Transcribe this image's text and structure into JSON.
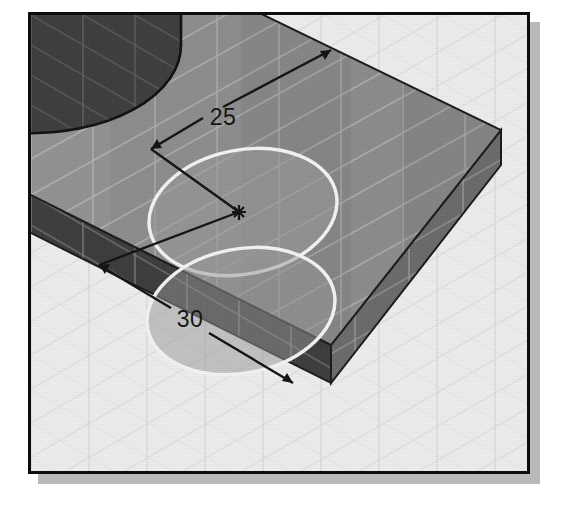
{
  "view": {
    "title": "Isometric solid model view",
    "frame_color": "#0d0d0d",
    "shadow_color": "#b9b9b9",
    "background_color": "#f2f2f2"
  },
  "scene": {
    "floor": {
      "name": "isometric-grid-floor",
      "color": "#e7e7e7",
      "grid_line_color": "#c8c8c8"
    },
    "part": {
      "name": "rectangular-base-plate",
      "top_face_color": "#8f8f8f",
      "left_face_color": "#3c3c3c",
      "right_face_color": "#6a6a6a",
      "edge_color": "#1a1a1a",
      "grid_line_color": "#bdbdbd"
    },
    "boss": {
      "name": "cylindrical-boss",
      "top_color": "#494949",
      "side_color": "#3a3a3a",
      "edge_color": "#141414"
    },
    "circles": [
      {
        "name": "upper-circle-feature",
        "outline_color": "#f0f0f0",
        "fill_color": "#9a9a9a"
      },
      {
        "name": "lower-circle-feature",
        "outline_color": "#f0f0f0",
        "fill_color": "#969696"
      }
    ],
    "center_marker": {
      "name": "circle-center-point",
      "glyph": "asterisk",
      "color": "#141414"
    }
  },
  "dimensions": [
    {
      "id": "vertical-offset-dimension",
      "label": "25",
      "color": "#141414",
      "description": "Distance from back edge of plate to circle center"
    },
    {
      "id": "horizontal-offset-dimension",
      "label": "30",
      "color": "#141414",
      "description": "Distance from circle center to front edge of plate"
    }
  ]
}
